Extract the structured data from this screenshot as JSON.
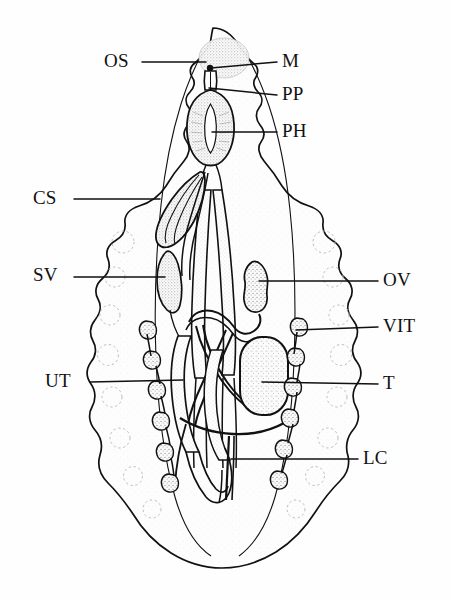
{
  "figure": {
    "type": "anatomical-line-drawing",
    "background_color": "#fefefe",
    "ink_color": "#111111",
    "stipple_color": "#9a9a9a",
    "labels": [
      {
        "id": "os",
        "text": "OS",
        "meaning": "oral sucker",
        "side": "left",
        "x": 104,
        "y": 51,
        "leader": {
          "x1": 142,
          "y1": 62,
          "x2": 206,
          "y2": 62
        }
      },
      {
        "id": "m",
        "text": "M",
        "meaning": "mouth",
        "side": "right",
        "x": 282,
        "y": 51,
        "leader": {
          "x1": 277,
          "y1": 62,
          "x2": 211,
          "y2": 68
        }
      },
      {
        "id": "pp",
        "text": "PP",
        "meaning": "prepharynx",
        "side": "right",
        "x": 282,
        "y": 84,
        "leader": {
          "x1": 277,
          "y1": 95,
          "x2": 209,
          "y2": 88
        }
      },
      {
        "id": "ph",
        "text": "PH",
        "meaning": "pharynx",
        "side": "right",
        "x": 282,
        "y": 121,
        "leader": {
          "x1": 277,
          "y1": 132,
          "x2": 212,
          "y2": 132
        }
      },
      {
        "id": "cs",
        "text": "CS",
        "meaning": "cirrus sac",
        "side": "left",
        "x": 33,
        "y": 188,
        "leader": {
          "x1": 74,
          "y1": 199,
          "x2": 160,
          "y2": 199
        }
      },
      {
        "id": "sv",
        "text": "SV",
        "meaning": "seminal vesicle",
        "side": "left",
        "x": 33,
        "y": 265,
        "leader": {
          "x1": 74,
          "y1": 277,
          "x2": 165,
          "y2": 277
        }
      },
      {
        "id": "ov",
        "text": "OV",
        "meaning": "ovary",
        "side": "right",
        "x": 383,
        "y": 270,
        "leader": {
          "x1": 378,
          "y1": 281,
          "x2": 259,
          "y2": 281
        }
      },
      {
        "id": "vit",
        "text": "VIT",
        "meaning": "vitellaria",
        "side": "right",
        "x": 383,
        "y": 316,
        "leader": {
          "x1": 378,
          "y1": 327,
          "x2": 296,
          "y2": 330
        }
      },
      {
        "id": "ut",
        "text": "UT",
        "meaning": "uterus",
        "side": "left",
        "x": 45,
        "y": 371,
        "leader": {
          "x1": 90,
          "y1": 382,
          "x2": 183,
          "y2": 380
        }
      },
      {
        "id": "t",
        "text": "T",
        "meaning": "testis",
        "side": "right",
        "x": 383,
        "y": 373,
        "leader": {
          "x1": 378,
          "y1": 384,
          "x2": 262,
          "y2": 382
        }
      },
      {
        "id": "lc",
        "text": "LC",
        "meaning": "lateral canal",
        "side": "right",
        "x": 363,
        "y": 448,
        "leader": {
          "x1": 358,
          "y1": 459,
          "x2": 231,
          "y2": 459
        }
      }
    ]
  }
}
